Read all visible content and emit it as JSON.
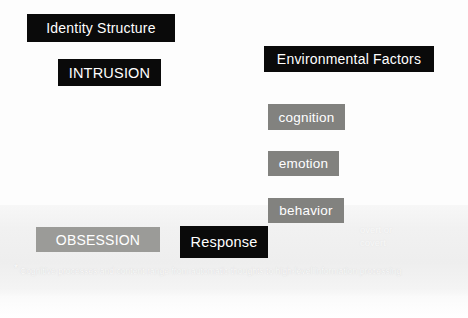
{
  "diagram": {
    "nodes": [
      {
        "id": "identity-structure",
        "label": "Identity  Structure",
        "style": "dark"
      },
      {
        "id": "intrusion",
        "label": "INTRUSION",
        "style": "dark"
      },
      {
        "id": "environmental-factors",
        "label": "Environmental Factors",
        "style": "dark"
      },
      {
        "id": "cognition",
        "label": "cognition",
        "style": "gray"
      },
      {
        "id": "emotion",
        "label": "emotion",
        "style": "gray"
      },
      {
        "id": "behavior",
        "label": "behavior",
        "style": "gray"
      },
      {
        "id": "obsession",
        "label": "OBSESSION",
        "style": "gray-light"
      },
      {
        "id": "response",
        "label": "Response",
        "style": "dark"
      }
    ],
    "covert_label": {
      "line1": "overt or",
      "line2": "covert"
    },
    "footnote": {
      "marker": "*",
      "text": "Cognitive processes and content range from automatic thoughts to high-level information processing"
    },
    "colors": {
      "dark_box": "#0a0a0a",
      "gray_box": "#82827f",
      "gray_light_box": "#9b9b98",
      "box_text": "#ffffff",
      "page_background": "#fdfdfd",
      "wash": "#f1f1f1"
    }
  }
}
